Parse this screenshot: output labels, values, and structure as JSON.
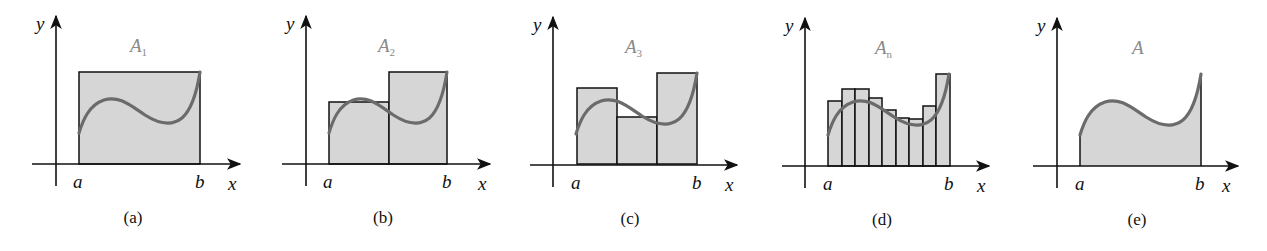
{
  "figure": {
    "axis_labels": {
      "x": "x",
      "y": "y",
      "left_bound": "a",
      "right_bound": "b"
    },
    "colors": {
      "fill": "#d6d6d6",
      "curve": "#6b6b6b",
      "axis": "#111111",
      "title": "#8a8a8a"
    },
    "panels": [
      {
        "caption": "(a)",
        "title": "A",
        "title_sub": "1",
        "rectangles": 1
      },
      {
        "caption": "(b)",
        "title": "A",
        "title_sub": "2",
        "rectangles": 2
      },
      {
        "caption": "(c)",
        "title": "A",
        "title_sub": "3",
        "rectangles": 3
      },
      {
        "caption": "(d)",
        "title": "A",
        "title_sub": "n",
        "rectangles": 9
      },
      {
        "caption": "(e)",
        "title": "A",
        "title_sub": "",
        "rectangles": 0
      }
    ]
  }
}
